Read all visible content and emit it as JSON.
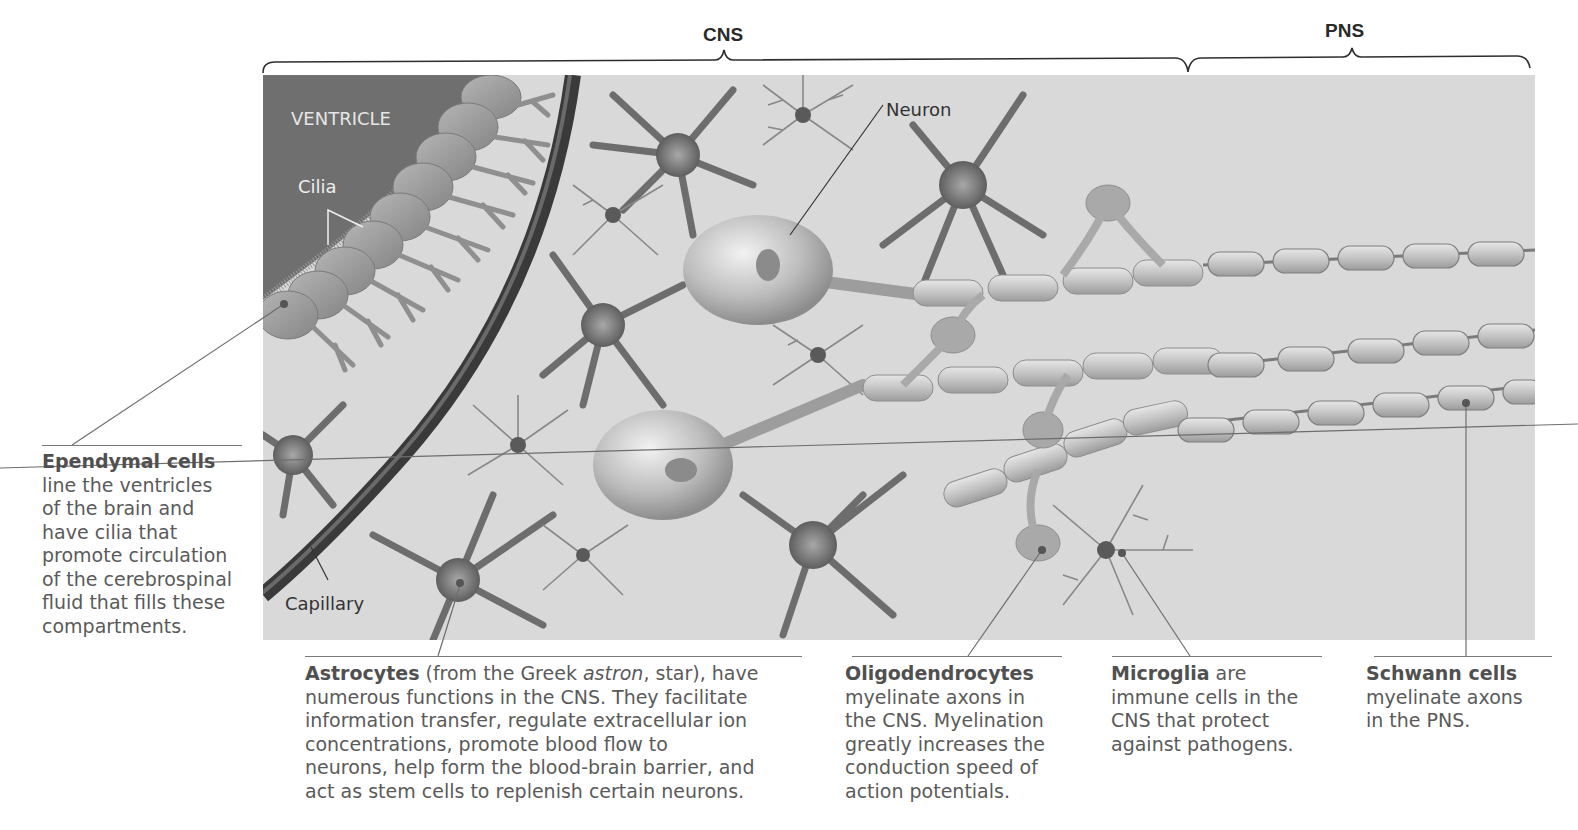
{
  "brackets": {
    "cns": "CNS",
    "pns": "PNS"
  },
  "illustration_labels": {
    "ventricle": "VENTRICLE",
    "cilia": "Cilia",
    "neuron": "Neuron",
    "capillary": "Capillary"
  },
  "captions": {
    "ependymal": {
      "title": "Ependymal cells",
      "lines": [
        "line the ventricles",
        "of the brain and",
        "have cilia that",
        "promote circulation",
        "of the cerebrospinal",
        "fluid that fills these",
        "compartments."
      ]
    },
    "astrocytes": {
      "title": "Astrocytes",
      "line1_pre": " (from the Greek ",
      "line1_italic": "astron",
      "line1_post": ", star), have",
      "lines": [
        "numerous functions in the CNS. They facilitate",
        "information transfer, regulate extracellular ion",
        "concentrations, promote blood flow to",
        "neurons, help form the blood-brain barrier, and",
        "act as stem cells to replenish certain neurons."
      ]
    },
    "oligodendrocytes": {
      "title": "Oligodendrocytes",
      "lines": [
        "myelinate axons in",
        "the CNS. Myelination",
        "greatly increases the",
        "conduction speed of",
        "action potentials."
      ]
    },
    "microglia": {
      "title": "Microglia",
      "title_suffix": " are",
      "lines": [
        "immune cells in the",
        "CNS that protect",
        "against pathogens."
      ]
    },
    "schwann": {
      "title": "Schwann cells",
      "lines": [
        "myelinate axons",
        "in the PNS."
      ]
    }
  },
  "colors": {
    "background": "#ffffff",
    "tissue": "#d9d9d9",
    "ventricle": "#6f6f6f",
    "capillary": "#3a3a3a",
    "cell": "#8a8a8a",
    "myelin": "#b8b8b8",
    "text": "#5a5a5a"
  }
}
